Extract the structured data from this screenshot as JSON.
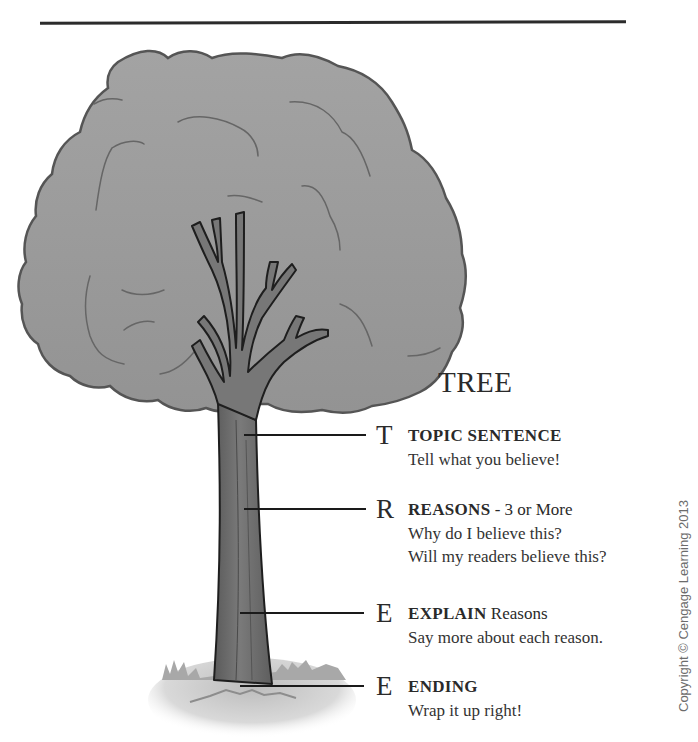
{
  "header": {
    "cropped_text": "· · · · · · · · ·",
    "rule": true
  },
  "diagram": {
    "title": "TREE",
    "entries": [
      {
        "letter": "T",
        "heading": "TOPIC SENTENCE",
        "heading_rest": "",
        "lines": [
          "Tell what you believe!"
        ]
      },
      {
        "letter": "R",
        "heading": "REASONS",
        "heading_rest": " - 3 or More",
        "lines": [
          "Why do I believe this?",
          "Will my readers believe this?"
        ]
      },
      {
        "letter": "E",
        "heading": "EXPLAIN",
        "heading_rest": " Reasons",
        "lines": [
          "Say more about each reason."
        ]
      },
      {
        "letter": "E",
        "heading": "ENDING",
        "heading_rest": "",
        "lines": [
          "Wrap it up right!"
        ]
      }
    ],
    "parts": [
      "canopy",
      "branches",
      "trunk",
      "ground"
    ]
  },
  "copyright": "Copyright © Cengage Learning 2013",
  "colors": {
    "canopy_fill": "#9a9a9a",
    "canopy_outline": "#555555",
    "trunk_fill": "#6e6e6e",
    "outline": "#1e1e1e",
    "ground": "#b8b8b8",
    "text": "#2a2a2a"
  }
}
